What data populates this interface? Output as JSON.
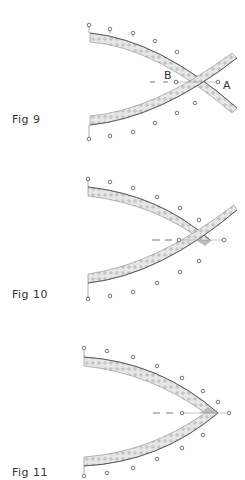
{
  "figures": [
    {
      "id": "fig9",
      "label": "Fig 9",
      "point_labels": {
        "b": "B",
        "a": "A"
      },
      "description": "Two curved studded strips crossing, with extension beyond crossing; points B and A on dashed center line"
    },
    {
      "id": "fig10",
      "label": "Fig 10",
      "description": "Strips overlapping at tip with one strip extending diagonally; dashed center line"
    },
    {
      "id": "fig11",
      "label": "Fig 11",
      "description": "Strips joined to a pointed tip; dashed center line"
    }
  ],
  "colors": {
    "strip_fill": "#e4e4e4",
    "strip_edge": "#555555",
    "stud": "#9a9a9a",
    "pin": "#555555",
    "dash": "#555555"
  }
}
